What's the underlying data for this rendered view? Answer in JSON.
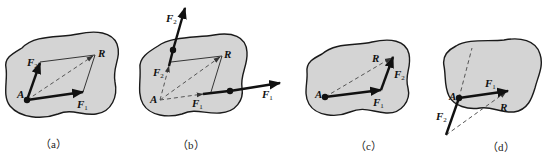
{
  "figure": {
    "panels": [
      {
        "id": "a",
        "caption": "（a）",
        "labels": {
          "point": "A",
          "f1": "F",
          "f1_sub": "1",
          "f2": "F",
          "f2_sub": "2",
          "resultant": "R"
        },
        "description": "Parallelogram rule: forces F1 and F2 acting at point A with resultant R as diagonal"
      },
      {
        "id": "b",
        "caption": "（b）",
        "labels": {
          "point": "A",
          "f1": "F",
          "f1_sub": "1",
          "f2": "F",
          "f2_sub": "2",
          "f1_ext": "F",
          "f1_ext_sub": "1",
          "f2_ext": "F",
          "f2_ext_sub": "2",
          "resultant": "R"
        },
        "description": "Forces F1 and F2 acting at different points, lines of action extended to intersect at A"
      },
      {
        "id": "c",
        "caption": "（c）",
        "labels": {
          "point": "A",
          "f1": "F",
          "f1_sub": "1",
          "f2": "F",
          "f2_sub": "2",
          "resultant": "R"
        },
        "description": "Triangle rule: F2 placed head-to-tail after F1, R closes triangle"
      },
      {
        "id": "d",
        "caption": "（d）",
        "labels": {
          "point": "A",
          "f1": "F",
          "f1_sub": "1",
          "f2": "F",
          "f2_sub": "2",
          "resultant": "R"
        },
        "description": "Triangle rule variant: F2 drawn first then F1, R from tail of F2 to tip of F1"
      }
    ]
  }
}
